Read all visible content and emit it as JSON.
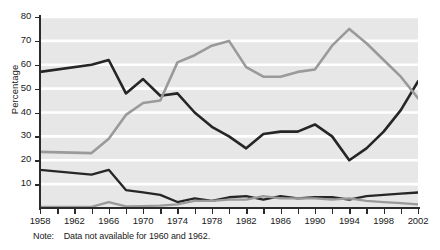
{
  "chart_data": {
    "type": "line",
    "title": "",
    "xlabel": "",
    "ylabel": "Percentage",
    "xlim": [
      1958,
      2002
    ],
    "ylim": [
      0,
      80
    ],
    "ytick_values": [
      0,
      10,
      20,
      30,
      40,
      50,
      60,
      70,
      80
    ],
    "ytick_labels": [
      "",
      "10",
      "20",
      "30",
      "40",
      "50",
      "60",
      "70",
      "80"
    ],
    "xtick_values": [
      1958,
      1960,
      1962,
      1964,
      1966,
      1968,
      1970,
      1972,
      1974,
      1976,
      1978,
      1980,
      1982,
      1984,
      1986,
      1988,
      1990,
      1992,
      1994,
      1996,
      1998,
      2000,
      2002
    ],
    "xtick_labels": [
      "1958",
      "",
      "1962",
      "",
      "1966",
      "",
      "1970",
      "",
      "1974",
      "",
      "1978",
      "",
      "1982",
      "",
      "1986",
      "",
      "1990",
      "",
      "1994",
      "",
      "1998",
      "",
      "2002"
    ],
    "grid": "horizontal-white",
    "legend": "none",
    "note": "Note:  Data not available for 1960 and 1962.",
    "note_label": "Note:",
    "note_text": "Data not available for 1960 and 1962.",
    "x": [
      1958,
      1964,
      1966,
      1968,
      1970,
      1972,
      1974,
      1976,
      1978,
      1980,
      1982,
      1984,
      1986,
      1988,
      1990,
      1992,
      1994,
      1996,
      1998,
      2000,
      2002
    ],
    "series": [
      {
        "name": "series-dark-upper",
        "color": "#262626",
        "width": 2.6,
        "values": [
          57,
          60,
          62,
          48,
          54,
          47,
          48,
          40,
          34,
          30,
          25,
          31,
          32,
          32,
          35,
          30,
          20,
          25,
          32,
          41,
          53
        ]
      },
      {
        "name": "series-gray-upper",
        "color": "#9a9a9a",
        "width": 2.6,
        "values": [
          23.5,
          23,
          29,
          39,
          44,
          45,
          61,
          64,
          68,
          70,
          59,
          55,
          55,
          57,
          58,
          68,
          75,
          69,
          62,
          55,
          46
        ]
      },
      {
        "name": "series-dark-lower",
        "color": "#262626",
        "width": 2.3,
        "values": [
          16,
          14,
          16,
          7.5,
          6.5,
          5.5,
          2.5,
          4,
          3,
          4.5,
          5,
          3.5,
          5,
          4,
          4.5,
          4.5,
          3.5,
          5,
          5.5,
          6,
          6.5
        ]
      },
      {
        "name": "series-gray-lower",
        "color": "#9a9a9a",
        "width": 2.3,
        "values": [
          0.5,
          0.5,
          2.5,
          0.7,
          0.8,
          1,
          1.5,
          3,
          3,
          3.5,
          3.5,
          5,
          4,
          4,
          4,
          3.5,
          4,
          3,
          2.5,
          2,
          1.5
        ]
      }
    ]
  }
}
